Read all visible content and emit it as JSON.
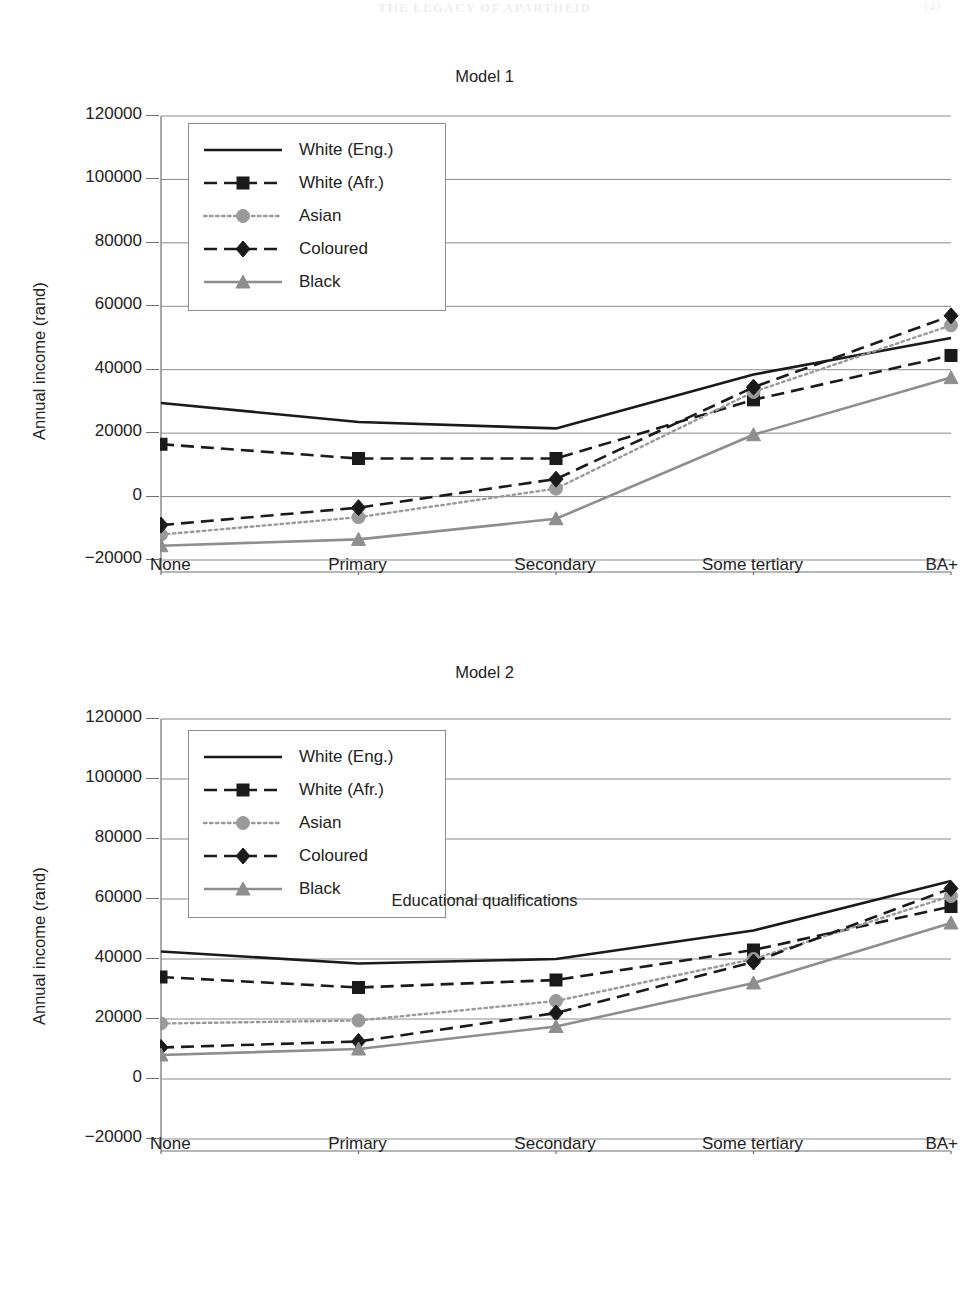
{
  "running_head": {
    "text": "THE LEGACY OF APARTHEID",
    "folio": "143"
  },
  "axis": {
    "ylabel": "Annual income (rand)",
    "xlabel": "Educational qualifications",
    "yticks": [
      "120000",
      "100000",
      "80000",
      "60000",
      "40000",
      "20000",
      "0",
      "−20000"
    ],
    "xticks": [
      "None",
      "Primary",
      "Secondary",
      "Some tertiary",
      "BA+"
    ]
  },
  "legend": {
    "items": [
      {
        "label": "White (Eng.)",
        "key": "solid-black-line",
        "color": "#1a1a1a",
        "dash": "none",
        "marker": "none"
      },
      {
        "label": "White (Afr.)",
        "key": "dashed-black-square-line",
        "color": "#1a1a1a",
        "dash": "long",
        "marker": "square"
      },
      {
        "label": "Asian",
        "key": "dotted-grey-circle-line",
        "color": "#9a9a9a",
        "dash": "dotted",
        "marker": "circle"
      },
      {
        "label": "Coloured",
        "key": "dashed-black-diamond-line",
        "color": "#1a1a1a",
        "dash": "long",
        "marker": "diamond"
      },
      {
        "label": "Black",
        "key": "solid-grey-triangle-line",
        "color": "#8e8e8e",
        "dash": "none",
        "marker": "triangle"
      }
    ]
  },
  "chart_data": [
    {
      "type": "line",
      "title": "Model 1",
      "xlabel": "",
      "ylabel": "Annual income (rand)",
      "categories": [
        "None",
        "Primary",
        "Secondary",
        "Some tertiary",
        "BA+"
      ],
      "ylim": [
        -20000,
        120000
      ],
      "ytick_step": 20000,
      "grid": "horizontal",
      "legend_position": "upper-left-inside",
      "series": [
        {
          "name": "White (Eng.)",
          "color": "#1a1a1a",
          "dash": "none",
          "marker": "none",
          "values": [
            29500,
            23500,
            21500,
            38500,
            50000
          ]
        },
        {
          "name": "White (Afr.)",
          "color": "#1a1a1a",
          "dash": "long",
          "marker": "square",
          "values": [
            16500,
            12000,
            12000,
            30500,
            44500
          ]
        },
        {
          "name": "Asian",
          "color": "#9a9a9a",
          "dash": "dotted",
          "marker": "circle",
          "values": [
            -12000,
            -6500,
            2500,
            33000,
            54000
          ]
        },
        {
          "name": "Coloured",
          "color": "#1a1a1a",
          "dash": "long",
          "marker": "diamond",
          "values": [
            -9000,
            -3500,
            5500,
            34500,
            57000
          ]
        },
        {
          "name": "Black",
          "color": "#8e8e8e",
          "dash": "none",
          "marker": "triangle",
          "values": [
            -15500,
            -13500,
            -7000,
            19500,
            37500
          ]
        }
      ]
    },
    {
      "type": "line",
      "title": "Model 2",
      "xlabel": "Educational qualifications",
      "ylabel": "Annual income (rand)",
      "categories": [
        "None",
        "Primary",
        "Secondary",
        "Some tertiary",
        "BA+"
      ],
      "ylim": [
        -20000,
        120000
      ],
      "ytick_step": 20000,
      "grid": "horizontal",
      "legend_position": "upper-left-inside",
      "series": [
        {
          "name": "White (Eng.)",
          "color": "#1a1a1a",
          "dash": "none",
          "marker": "none",
          "values": [
            42500,
            38500,
            40000,
            49500,
            66000
          ]
        },
        {
          "name": "White (Afr.)",
          "color": "#1a1a1a",
          "dash": "long",
          "marker": "square",
          "values": [
            34000,
            30500,
            33000,
            43000,
            57500
          ]
        },
        {
          "name": "Asian",
          "color": "#9a9a9a",
          "dash": "dotted",
          "marker": "circle",
          "values": [
            18500,
            19500,
            26000,
            40000,
            61000
          ]
        },
        {
          "name": "Coloured",
          "color": "#1a1a1a",
          "dash": "long",
          "marker": "diamond",
          "values": [
            10500,
            12500,
            22000,
            39000,
            63500
          ]
        },
        {
          "name": "Black",
          "color": "#8e8e8e",
          "dash": "none",
          "marker": "triangle",
          "values": [
            8000,
            10000,
            17500,
            32000,
            52000
          ]
        }
      ]
    }
  ]
}
